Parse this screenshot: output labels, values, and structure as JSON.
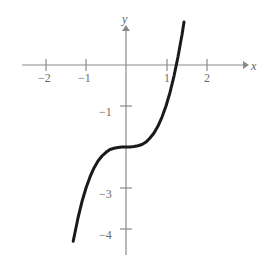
{
  "figure": {
    "background_color": "#ffffff",
    "axis_color": "#8a8a8a",
    "curve_color": "#1a1a1a",
    "label_color": "#6b6b6b"
  },
  "axes": {
    "x_name": "x",
    "y_name": "y",
    "origin_px": {
      "x": 126,
      "y": 65
    },
    "px_per_unit_x": 40,
    "px_per_unit_y": 41
  },
  "chart_data": {
    "type": "line",
    "title": "",
    "xlabel": "x",
    "ylabel": "y",
    "xlim": [
      -2.6,
      2.9
    ],
    "ylim": [
      -4.6,
      0.7
    ],
    "grid": false,
    "legend": null,
    "function": "y = x^3 - 2",
    "x_ticks": [
      -2,
      -1,
      1,
      2
    ],
    "x_tick_labels": [
      "−2",
      "−1",
      "1",
      "2"
    ],
    "y_ticks": [
      -1,
      -3,
      -4
    ],
    "y_tick_labels": [
      "−1",
      "−3",
      "−4"
    ],
    "x_axis_range_px": [
      22,
      245
    ],
    "y_axis_range_px": [
      28,
      255
    ],
    "inflection_point": [
      0,
      -2
    ],
    "x_intercept": 1.26,
    "curve_domain": [
      -1.32,
      1.45
    ],
    "x": [
      -1.32,
      -1.2,
      -1.1,
      -1.0,
      -0.9,
      -0.8,
      -0.7,
      -0.6,
      -0.5,
      -0.4,
      -0.3,
      -0.2,
      -0.1,
      0.0,
      0.1,
      0.2,
      0.3,
      0.4,
      0.5,
      0.6,
      0.7,
      0.8,
      0.9,
      1.0,
      1.1,
      1.2,
      1.3,
      1.4,
      1.45
    ],
    "y": [
      -4.3,
      -3.73,
      -3.33,
      -3.0,
      -2.73,
      -2.51,
      -2.34,
      -2.22,
      -2.13,
      -2.06,
      -2.03,
      -2.01,
      -2.0,
      -2.0,
      -2.0,
      -1.99,
      -1.97,
      -1.94,
      -1.88,
      -1.78,
      -1.66,
      -1.49,
      -1.27,
      -1.0,
      -0.67,
      -0.27,
      0.2,
      0.74,
      1.05
    ]
  },
  "labels": {
    "x_minus_2": "−2",
    "x_minus_1": "−1",
    "x_plus_1": "1",
    "x_plus_2": "2",
    "y_minus_1": "−1",
    "y_minus_3": "−3",
    "y_minus_4": "−4",
    "axis_x": "x",
    "axis_y": "y"
  }
}
